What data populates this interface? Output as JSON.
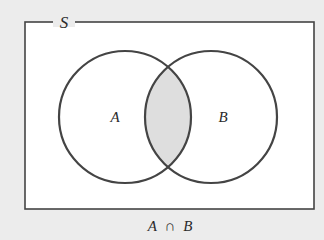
{
  "diagram": {
    "type": "venn",
    "universe_label": "S",
    "sets": [
      {
        "label": "A",
        "cx": 125,
        "cy": 117,
        "r": 66
      },
      {
        "label": "B",
        "cx": 211,
        "cy": 117,
        "r": 66
      }
    ],
    "shaded_region": "intersection",
    "caption": {
      "left": "A",
      "operator": "∩",
      "right": "B"
    }
  },
  "colors": {
    "background": "#ececec",
    "universe_fill": "#ffffff",
    "stroke": "#444444",
    "shade": "#dedede",
    "text": "#2a2a2a"
  }
}
